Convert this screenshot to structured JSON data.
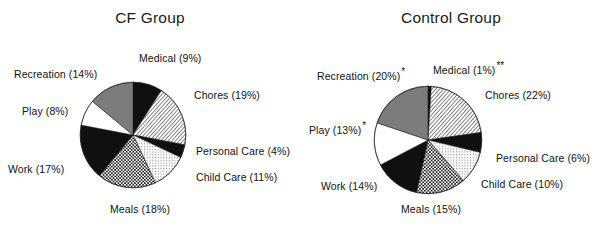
{
  "figure": {
    "kind": "two-pie-figure",
    "background": "#ffffff"
  },
  "charts": [
    {
      "id": "cf",
      "title": "CF Group",
      "type": "pie",
      "start_angle_deg": 0,
      "direction": "clockwise",
      "labels": [
        "Medical",
        "Chores",
        "Personal Care",
        "Child Care",
        "Meals",
        "Work",
        "Play",
        "Recreation"
      ],
      "values": [
        9,
        19,
        4,
        11,
        18,
        17,
        8,
        14
      ],
      "value_texts": [
        "(9%)",
        "(19%)",
        "(4%)",
        "(11%)",
        "(18%)",
        "(17%)",
        "(8%)",
        "(14%)"
      ],
      "significance": [
        "",
        "",
        "",
        "",
        "",
        "",
        "",
        ""
      ],
      "fills": [
        "solid-black",
        "diagonal-hatch",
        "solid-black",
        "light-dots",
        "medium-check",
        "solid-black",
        "solid-white",
        "solid-gray"
      ],
      "colors": {
        "solid-black": "#101010",
        "solid-white": "#ffffff",
        "solid-gray": "#7c7c7c",
        "hatch-line": "#2b2b2b",
        "outline": "#1a1a1a"
      }
    },
    {
      "id": "control",
      "title": "Control Group",
      "type": "pie",
      "start_angle_deg": 0,
      "direction": "clockwise",
      "labels": [
        "Medical",
        "Chores",
        "Personal Care",
        "Child Care",
        "Meals",
        "Work",
        "Play",
        "Recreation"
      ],
      "values": [
        1,
        22,
        6,
        10,
        15,
        14,
        13,
        20
      ],
      "value_texts": [
        "(1%)",
        "(22%)",
        "(6%)",
        "(10%)",
        "(15%)",
        "(14%)",
        "(13%)",
        "(20%)"
      ],
      "significance": [
        "**",
        "",
        "",
        "",
        "",
        "",
        "*",
        "*"
      ],
      "fills": [
        "solid-black",
        "diagonal-hatch",
        "solid-black",
        "light-dots",
        "medium-check",
        "solid-black",
        "solid-white",
        "solid-gray"
      ],
      "colors": {
        "solid-black": "#101010",
        "solid-white": "#ffffff",
        "solid-gray": "#7c7c7c",
        "hatch-line": "#2b2b2b",
        "outline": "#1a1a1a"
      }
    }
  ],
  "chart_data": [
    {
      "type": "pie",
      "title": "CF Group",
      "categories": [
        "Medical",
        "Chores",
        "Personal Care",
        "Child Care",
        "Meals",
        "Work",
        "Play",
        "Recreation"
      ],
      "values": [
        9,
        19,
        4,
        11,
        18,
        17,
        8,
        14
      ],
      "unit": "percent",
      "total": 100,
      "xlabel": "",
      "ylabel": "",
      "legend": "none",
      "grid": false,
      "annotations": []
    },
    {
      "type": "pie",
      "title": "Control Group",
      "categories": [
        "Medical",
        "Chores",
        "Personal Care",
        "Child Care",
        "Meals",
        "Work",
        "Play",
        "Recreation"
      ],
      "values": [
        1,
        22,
        6,
        10,
        15,
        14,
        13,
        20
      ],
      "unit": "percent",
      "total": 101,
      "xlabel": "",
      "ylabel": "",
      "legend": "none",
      "grid": false,
      "annotations": [
        {
          "category": "Medical",
          "mark": "**"
        },
        {
          "category": "Recreation",
          "mark": "*"
        },
        {
          "category": "Play",
          "mark": "*"
        }
      ]
    }
  ]
}
